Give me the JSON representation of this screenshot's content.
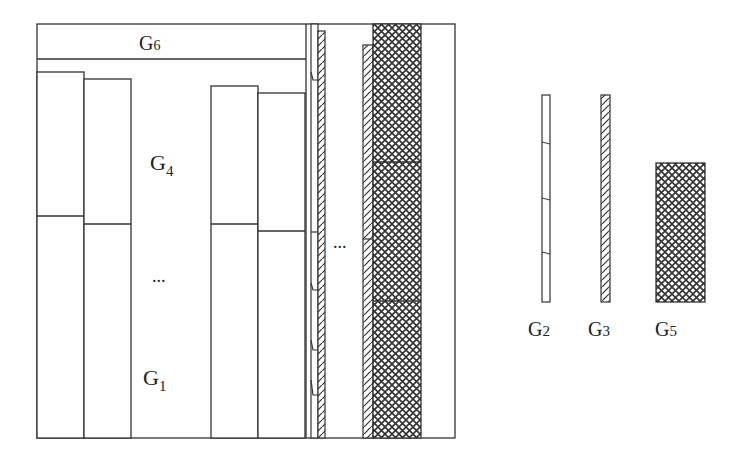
{
  "diagram": {
    "labels": {
      "g6": "G",
      "g6_sub": "6",
      "g4": "G",
      "g4_sub": "4",
      "g1": "G",
      "g1_sub": "1",
      "ellipsis_left": "...",
      "ellipsis_right": "..."
    },
    "legend": {
      "items": [
        {
          "name": "G",
          "sub": "2",
          "pattern": "plain-thin-strip"
        },
        {
          "name": "G",
          "sub": "3",
          "pattern": "diagonal-hatch-thin-strip"
        },
        {
          "name": "G",
          "sub": "5",
          "pattern": "cross-hatch-block"
        }
      ]
    },
    "colors": {
      "stroke": "#333333",
      "fill": "#ffffff"
    }
  }
}
